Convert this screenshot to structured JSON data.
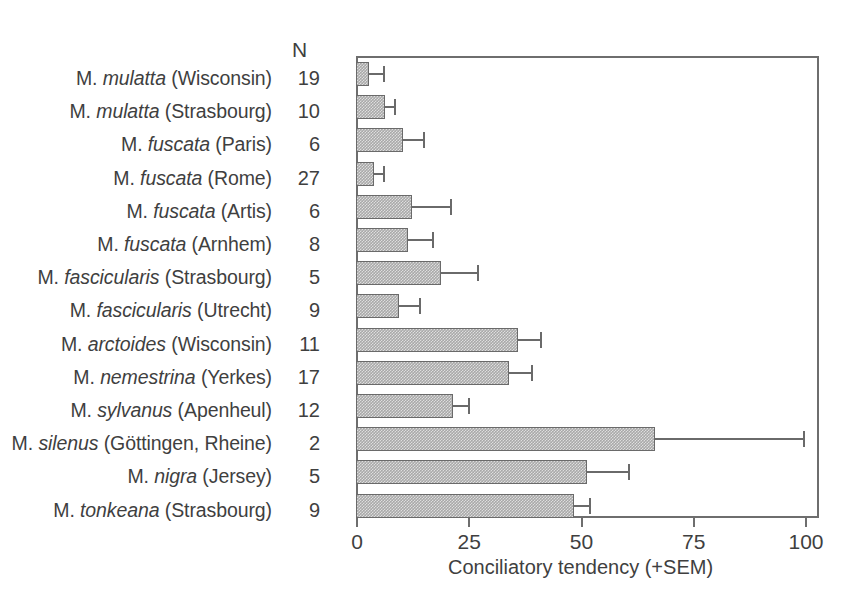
{
  "chart_data": {
    "type": "bar",
    "orientation": "horizontal",
    "title": "",
    "xlabel": "Conciliatory tendency (+SEM)",
    "ylabel": "",
    "xlim": [
      0,
      100
    ],
    "xticks": [
      0,
      25,
      50,
      75,
      100
    ],
    "xtick_labels": [
      "0",
      "25",
      "50",
      "75",
      "100"
    ],
    "grid": false,
    "legend": null,
    "n_column_header": "N",
    "categories": [
      "M. mulatta (Wisconsin)",
      "M. mulatta (Strasbourg)",
      "M. fuscata (Paris)",
      "M. fuscata (Rome)",
      "M. fuscata (Artis)",
      "M. fuscata (Arnhem)",
      "M. fascicularis (Strasbourg)",
      "M. fascicularis (Utrecht)",
      "M. arctoides (Wisconsin)",
      "M. nemestrina (Yerkes)",
      "M. sylvanus (Apenheul)",
      "M. silenus (Göttingen, Rheine)",
      "M. nigra (Jersey)",
      "M. tonkeana (Strasbourg)"
    ],
    "n_values": [
      19,
      10,
      6,
      27,
      6,
      8,
      5,
      9,
      11,
      17,
      12,
      2,
      5,
      9
    ],
    "values": [
      3,
      6.5,
      10.5,
      4,
      12.5,
      11.5,
      19,
      9.5,
      36,
      34,
      21.5,
      66.5,
      51.5,
      48.5
    ],
    "sem": [
      3,
      2,
      4.5,
      2,
      8.5,
      5.5,
      8,
      4.5,
      5,
      5,
      3.5,
      33,
      9,
      3.5
    ],
    "rows": [
      {
        "genus": "M.",
        "species": "mulatta",
        "site": "(Wisconsin)",
        "n": "19",
        "value": 3,
        "sem": 3
      },
      {
        "genus": "M.",
        "species": "mulatta",
        "site": "(Strasbourg)",
        "n": "10",
        "value": 6.5,
        "sem": 2
      },
      {
        "genus": "M.",
        "species": "fuscata",
        "site": "(Paris)",
        "n": "6",
        "value": 10.5,
        "sem": 4.5
      },
      {
        "genus": "M.",
        "species": "fuscata",
        "site": "(Rome)",
        "n": "27",
        "value": 4,
        "sem": 2
      },
      {
        "genus": "M.",
        "species": "fuscata",
        "site": "(Artis)",
        "n": "6",
        "value": 12.5,
        "sem": 8.5
      },
      {
        "genus": "M.",
        "species": "fuscata",
        "site": "(Arnhem)",
        "n": "8",
        "value": 11.5,
        "sem": 5.5
      },
      {
        "genus": "M.",
        "species": "fascicularis",
        "site": "(Strasbourg)",
        "n": "5",
        "value": 19,
        "sem": 8
      },
      {
        "genus": "M.",
        "species": "fascicularis",
        "site": "(Utrecht)",
        "n": "9",
        "value": 9.5,
        "sem": 4.5
      },
      {
        "genus": "M.",
        "species": "arctoides",
        "site": "(Wisconsin)",
        "n": "11",
        "value": 36,
        "sem": 5
      },
      {
        "genus": "M.",
        "species": "nemestrina",
        "site": "(Yerkes)",
        "n": "17",
        "value": 34,
        "sem": 5
      },
      {
        "genus": "M.",
        "species": "sylvanus",
        "site": "(Apenheul)",
        "n": "12",
        "value": 21.5,
        "sem": 3.5
      },
      {
        "genus": "M.",
        "species": "silenus",
        "site": "(Göttingen, Rheine)",
        "n": "2",
        "value": 66.5,
        "sem": 33
      },
      {
        "genus": "M.",
        "species": "nigra",
        "site": "(Jersey)",
        "n": "5",
        "value": 51.5,
        "sem": 9
      },
      {
        "genus": "M.",
        "species": "tonkeana",
        "site": "(Strasbourg)",
        "n": "9",
        "value": 48.5,
        "sem": 3.5
      }
    ],
    "colors": {
      "bar_fill": "#a9a9a9",
      "bar_edge": "#6a6a6a",
      "axis": "#6e6e6e",
      "text": "#3f3f3f",
      "background": "#ffffff"
    }
  }
}
